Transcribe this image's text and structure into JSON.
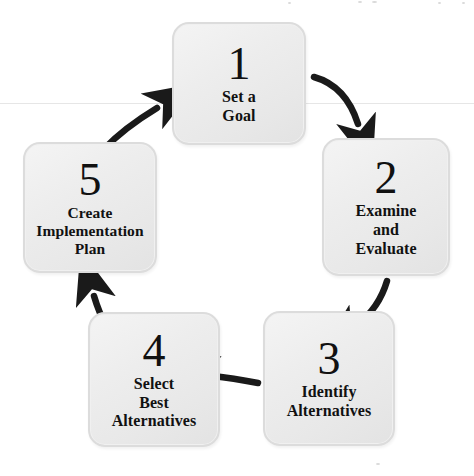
{
  "diagram": {
    "type": "cycle-flowchart",
    "background_color": "#ffffff",
    "box_fill_color": "#ededed",
    "box_border_color": "#dcdcdc",
    "text_color": "#111111",
    "arrow_color": "#1a1a1a",
    "steps": [
      {
        "number": "1",
        "label": "Set a\nGoal",
        "position": {
          "x": 172,
          "y": 22,
          "width": 134,
          "height": 123
        }
      },
      {
        "number": "2",
        "label": "Examine\nand\nEvaluate",
        "position": {
          "x": 322,
          "y": 138,
          "width": 128,
          "height": 138
        }
      },
      {
        "number": "3",
        "label": "Identify\nAlternatives",
        "position": {
          "x": 263,
          "y": 311,
          "width": 132,
          "height": 135
        }
      },
      {
        "number": "4",
        "label": "Select\nBest\nAlternatives",
        "position": {
          "x": 88,
          "y": 312,
          "width": 132,
          "height": 135
        }
      },
      {
        "number": "5",
        "label": "Create\nImplementation\nPlan",
        "position": {
          "x": 23,
          "y": 142,
          "width": 134,
          "height": 131
        }
      }
    ],
    "arrows": [
      {
        "name": "arrow-1-to-2",
        "from": "1",
        "to": "2",
        "direction": "down-right"
      },
      {
        "name": "arrow-2-to-3",
        "from": "2",
        "to": "3",
        "direction": "down-left"
      },
      {
        "name": "arrow-3-to-4",
        "from": "3",
        "to": "4",
        "direction": "left"
      },
      {
        "name": "arrow-4-to-5",
        "from": "4",
        "to": "5",
        "direction": "up-left"
      },
      {
        "name": "arrow-5-to-1",
        "from": "5",
        "to": "1",
        "direction": "up-right"
      }
    ]
  }
}
